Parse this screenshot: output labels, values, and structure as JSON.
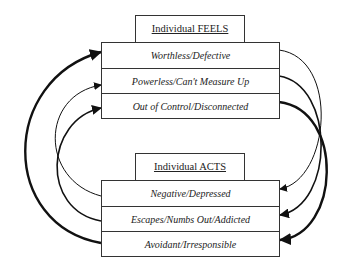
{
  "feels": {
    "title": "Individual FEELS",
    "items": [
      "Worthless/Defective",
      "Powerless/Can't Measure Up",
      "Out of Control/Disconnected"
    ]
  },
  "acts": {
    "title": "Individual ACTS",
    "items": [
      "Negative/Depressed",
      "Escapes/Numbs Out/Addicted",
      "Avoidant/Irresponsible"
    ]
  }
}
